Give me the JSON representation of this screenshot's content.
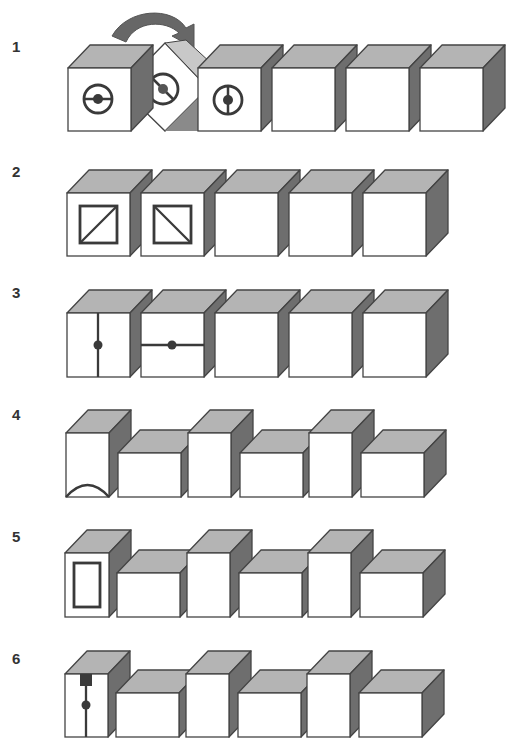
{
  "colors": {
    "front": "#ffffff",
    "top": "#b4b4b4",
    "side": "#6e6e6e",
    "stroke": "#444444",
    "symbol": "#3a3a3a",
    "arrow": "#676767",
    "rotating_top": "#c8c8c8",
    "rotating_dark": "#8a8a8a"
  },
  "rows": [
    {
      "label": "1",
      "label_y": 52,
      "description": "Row of six cubes; second cube rotating (arrow) showing circle symbols with dot and line"
    },
    {
      "label": "2",
      "label_y": 177,
      "description": "Row of five cubes; first two show squares with diagonals"
    },
    {
      "label": "3",
      "label_y": 298,
      "description": "Row of five cubes; first shows vertical line with dot, second horizontal line with dot"
    },
    {
      "label": "4",
      "label_y": 420,
      "description": "Alternating tall and wide blocks; first tall block has arc at bottom"
    },
    {
      "label": "5",
      "label_y": 542,
      "description": "Alternating tall and wide blocks; first tall block has inner rectangle"
    },
    {
      "label": "6",
      "label_y": 664,
      "description": "Alternating tall and wide blocks; first tall block has dark square, vertical line and dot"
    }
  ],
  "geometry": {
    "depth_x": 22,
    "depth_y": 23,
    "row1": {
      "top": 68,
      "bottom": 131,
      "cubes_x": [
        68,
        198,
        272,
        346,
        420
      ],
      "width": 63
    },
    "row2": {
      "top": 193,
      "bottom": 256,
      "cubes_x": [
        67,
        141,
        215,
        289,
        363
      ],
      "width": 63
    },
    "row3": {
      "top": 313,
      "bottom": 377,
      "cubes_x": [
        67,
        141,
        215,
        289,
        363
      ],
      "width": 63
    },
    "row4": {
      "bottom": 497,
      "blocks": [
        [
          66,
          43,
          64
        ],
        [
          118,
          63,
          44
        ],
        [
          188,
          43,
          64
        ],
        [
          240,
          63,
          44
        ],
        [
          309,
          43,
          64
        ],
        [
          361,
          63,
          44
        ]
      ]
    },
    "row5": {
      "bottom": 617,
      "blocks": [
        [
          65,
          44,
          64
        ],
        [
          117,
          63,
          44
        ],
        [
          187,
          43,
          64
        ],
        [
          239,
          63,
          44
        ],
        [
          308,
          43,
          64
        ],
        [
          360,
          63,
          44
        ]
      ]
    },
    "row6": {
      "bottom": 737,
      "blocks": [
        [
          65,
          43,
          63
        ],
        [
          116,
          63,
          44
        ],
        [
          186,
          43,
          63
        ],
        [
          238,
          63,
          44
        ],
        [
          307,
          43,
          63
        ],
        [
          359,
          63,
          44
        ]
      ]
    }
  }
}
